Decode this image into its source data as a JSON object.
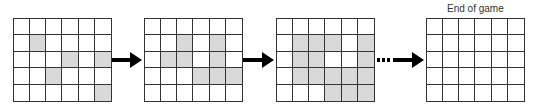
{
  "diagram": {
    "title_end": "End of game",
    "grid_rows": 5,
    "grid_cols": 6,
    "colors": {
      "shaded": "#d9d9d9",
      "empty": "#ffffff",
      "line": "#333333",
      "arrow": "#000000"
    },
    "grids": [
      {
        "name": "initial",
        "x": 13,
        "shaded": [
          [
            1,
            1
          ],
          [
            2,
            3
          ],
          [
            2,
            5
          ],
          [
            3,
            2
          ],
          [
            4,
            5
          ]
        ]
      },
      {
        "name": "step-2",
        "x": 144,
        "shaded": [
          [
            1,
            2
          ],
          [
            1,
            4
          ],
          [
            2,
            1
          ],
          [
            2,
            2
          ],
          [
            2,
            4
          ],
          [
            3,
            3
          ],
          [
            3,
            4
          ],
          [
            3,
            5
          ]
        ]
      },
      {
        "name": "step-3",
        "x": 276,
        "shaded": [
          [
            1,
            1
          ],
          [
            1,
            2
          ],
          [
            1,
            3
          ],
          [
            1,
            5
          ],
          [
            2,
            1
          ],
          [
            2,
            2
          ],
          [
            2,
            5
          ],
          [
            3,
            1
          ],
          [
            3,
            2
          ],
          [
            3,
            3
          ],
          [
            3,
            4
          ],
          [
            3,
            5
          ],
          [
            4,
            3
          ],
          [
            4,
            4
          ],
          [
            4,
            5
          ]
        ]
      },
      {
        "name": "end-of-game",
        "x": 426,
        "shaded": []
      }
    ],
    "arrows": [
      {
        "type": "solid",
        "x": 112,
        "width": 30
      },
      {
        "type": "solid",
        "x": 243,
        "width": 31
      },
      {
        "type": "dotted",
        "x": 377,
        "width": 47
      }
    ]
  }
}
